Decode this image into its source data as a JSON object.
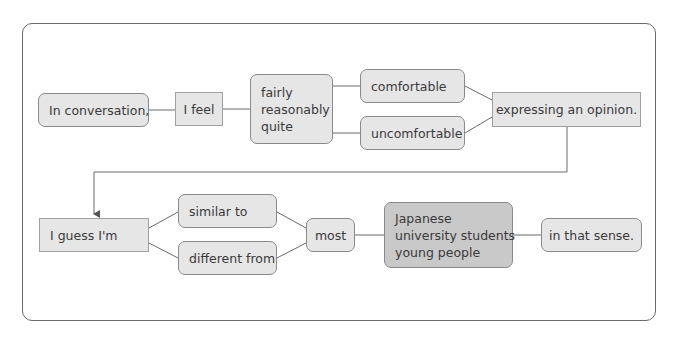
{
  "diagram": {
    "row1": {
      "start": "In conversation,",
      "verb": "I feel",
      "adverbs": [
        "fairly",
        "reasonably",
        "quite"
      ],
      "choices": [
        "comfortable",
        "uncomfortable"
      ],
      "end": "expressing an opinion."
    },
    "row2": {
      "start": "I guess I'm",
      "choices": [
        "similar to",
        "different from"
      ],
      "quantifier": "most",
      "groups": [
        "Japanese",
        "university students",
        "young people"
      ],
      "end": "in that sense."
    },
    "colors": {
      "box_fill": "#e6e6e6",
      "dark_box_fill": "#c9c9c9",
      "border": "#8a8a8a",
      "line": "#6a6a6a"
    }
  }
}
